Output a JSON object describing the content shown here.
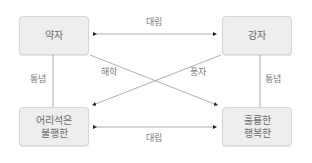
{
  "nodes": {
    "weak": {
      "lines": [
        "약자"
      ]
    },
    "strong": {
      "lines": [
        "강자"
      ]
    },
    "foolish_unhappy": {
      "lines": [
        "어리석은",
        "불행한"
      ]
    },
    "great_happy": {
      "lines": [
        "훌륭한",
        "행복한"
      ]
    }
  },
  "edges": {
    "top_relation": "대립",
    "bottom_relation": "대립",
    "left_relation": "통념",
    "right_relation": "통념",
    "diag_weak_to_great": "해학",
    "diag_strong_to_foolish": "풍자"
  },
  "colors": {
    "line": "#9a9a9a",
    "arrowhead": "#222222",
    "box_fill": "#eeeeee",
    "text": "#6a6a6a"
  }
}
